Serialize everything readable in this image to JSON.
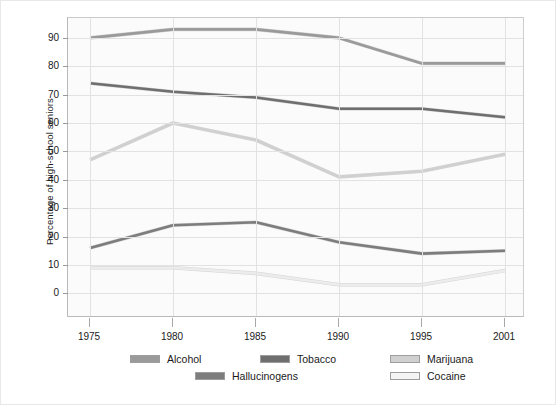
{
  "chart_data": {
    "type": "line",
    "title": "",
    "xlabel": "",
    "ylabel": "Percentage of high-school seniors",
    "x": [
      1975,
      1980,
      1985,
      1990,
      1995,
      2001
    ],
    "xtick_labels": [
      "1975",
      "1980",
      "1985",
      "1990",
      "1995",
      "2001"
    ],
    "ytick_labels": [
      "0",
      "10",
      "20",
      "30",
      "40",
      "50",
      "60",
      "70",
      "80",
      "90"
    ],
    "yticks": [
      0,
      10,
      20,
      30,
      40,
      50,
      60,
      70,
      80,
      90
    ],
    "ylim": [
      -8,
      97
    ],
    "grid": "both",
    "legend_position": "bottom",
    "series": [
      {
        "name": "Alcohol",
        "color": "#9a9a9a",
        "values": [
          90,
          93,
          93,
          90,
          81,
          81
        ]
      },
      {
        "name": "Tobacco",
        "color": "#6f6f6f",
        "values": [
          74,
          71,
          69,
          65,
          65,
          62
        ]
      },
      {
        "name": "Marijuana",
        "color": "#d0d0d0",
        "values": [
          47,
          60,
          54,
          41,
          43,
          49
        ]
      },
      {
        "name": "Hallucinogens",
        "color": "#7d7d7d",
        "values": [
          16,
          24,
          25,
          18,
          14,
          15
        ]
      },
      {
        "name": "Cocaine",
        "color": "#ececec",
        "values": [
          9,
          9,
          7,
          3,
          3,
          8
        ]
      }
    ]
  },
  "axis": {
    "y_title": "Percentage of high-school seniors"
  },
  "legend": {
    "items": [
      {
        "label": "Alcohol",
        "swatch": "#9a9a9a"
      },
      {
        "label": "Tobacco",
        "swatch": "#6f6f6f"
      },
      {
        "label": "Marijuana",
        "swatch": "#d0d0d0"
      },
      {
        "label": "Hallucinogens",
        "swatch": "#7d7d7d"
      },
      {
        "label": "Cocaine",
        "swatch": "#f4f4f4"
      }
    ]
  }
}
